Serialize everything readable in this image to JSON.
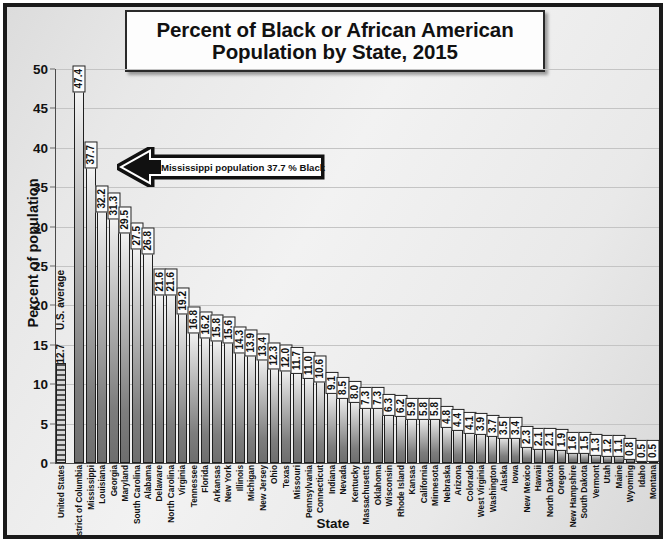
{
  "chart_data": {
    "type": "bar",
    "title": "Percent of Black or African American Population by State, 2015",
    "title_line1": "Percent of Black or African American",
    "title_line2": "Population by State, 2015",
    "xlabel": "State",
    "ylabel": "Percent of population",
    "ylim": [
      0,
      50
    ],
    "yticks": [
      0,
      5,
      10,
      15,
      20,
      25,
      30,
      35,
      40,
      45,
      50
    ],
    "grid": true,
    "legend": "none",
    "categories": [
      "United States",
      "District of Columbia",
      "Mississippi",
      "Louisiana",
      "Georgia",
      "Maryland",
      "South Carolina",
      "Alabama",
      "Delaware",
      "North Carolina",
      "Virginia",
      "Tennessee",
      "Florida",
      "Arkansas",
      "New York",
      "Illinois",
      "Michigan",
      "New Jersey",
      "Ohio",
      "Texas",
      "Missouri",
      "Pennsylvania",
      "Connecticut",
      "Indiana",
      "Nevada",
      "Kentucky",
      "Massachusetts",
      "Oklahoma",
      "Wisconsin",
      "Rhode Island",
      "Kansas",
      "California",
      "Minnesota",
      "Nebraska",
      "Arizona",
      "Colorado",
      "West Virginia",
      "Washington",
      "Alaska",
      "Iowa",
      "New Mexico",
      "Hawaii",
      "North Dakota",
      "Oregon",
      "New Hampshire",
      "South Dakota",
      "Vermont",
      "Utah",
      "Maine",
      "Wyoming",
      "Idaho",
      "Montana"
    ],
    "values": [
      12.7,
      47.4,
      37.7,
      32.2,
      31.3,
      29.5,
      27.5,
      26.8,
      21.6,
      21.6,
      19.2,
      16.8,
      16.2,
      15.8,
      15.6,
      14.3,
      13.9,
      13.4,
      12.3,
      12.0,
      11.7,
      11.0,
      10.6,
      9.1,
      8.5,
      8.0,
      7.3,
      7.3,
      6.3,
      6.2,
      5.9,
      5.8,
      5.8,
      4.8,
      4.4,
      4.1,
      3.9,
      3.7,
      3.5,
      3.4,
      2.3,
      2.1,
      2.1,
      1.9,
      1.6,
      1.5,
      1.3,
      1.2,
      1.1,
      0.8,
      0.5,
      0.5
    ],
    "value_labels": [
      "12.7",
      "47.4",
      "37.7",
      "32.2",
      "31.3",
      "29.5",
      "27.5",
      "26.8",
      "21.6",
      "21.6",
      "19.2",
      "16.8",
      "16.2",
      "15.8",
      "15.6",
      "14.3",
      "13.9",
      "13.4",
      "12.3",
      "12.0",
      "11.7",
      "11.0",
      "10.6",
      "9.1",
      "8.5",
      "8.0",
      "7.3",
      "7.3",
      "6.3",
      "6.2",
      "5.9",
      "5.8",
      "5.8",
      "4.8",
      "4.4",
      "4.1",
      "3.9",
      "3.7",
      "3.5",
      "3.4",
      "2.3",
      "2.1",
      "2.1",
      "1.9",
      "1.6",
      "1.5",
      "1.3",
      "1.2",
      "1.1",
      "0.8",
      "0.5",
      "0.5"
    ],
    "annotations": [
      {
        "name": "us-average-marker",
        "text": "U.S. average",
        "category": "United States",
        "value": 12.7
      },
      {
        "name": "mississippi-callout",
        "text": "Mississippi population 37.7 % Black",
        "category": "Mississippi",
        "value": 37.7
      }
    ],
    "colors": {
      "bar_light": "#f4f4f4",
      "bar_dark": "#6e6e6e",
      "bar_outline": "#1f1f1f",
      "average_bar_hatch": "#4f4f4f",
      "gridline": "#c4c4c4",
      "background": "#e9e9e9",
      "frame": "#1a1a1a",
      "text": "#111111"
    }
  }
}
